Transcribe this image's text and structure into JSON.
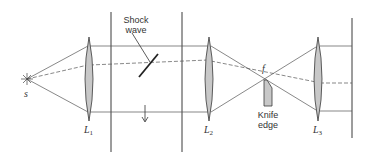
{
  "diagram": {
    "labels": {
      "source": "s",
      "shock_wave_line1": "Shock",
      "shock_wave_line2": "wave",
      "lens1": "L",
      "lens1_sub": "1",
      "lens2": "L",
      "lens2_sub": "2",
      "lens3": "L",
      "lens3_sub": "3",
      "focal_point": "f",
      "knife_edge_line1": "Knife",
      "knife_edge_line2": "edge"
    },
    "colors": {
      "line": "#3a3a3a",
      "lens_fill": "#c8c8c8",
      "knife_fill": "#c8c8c8"
    }
  }
}
